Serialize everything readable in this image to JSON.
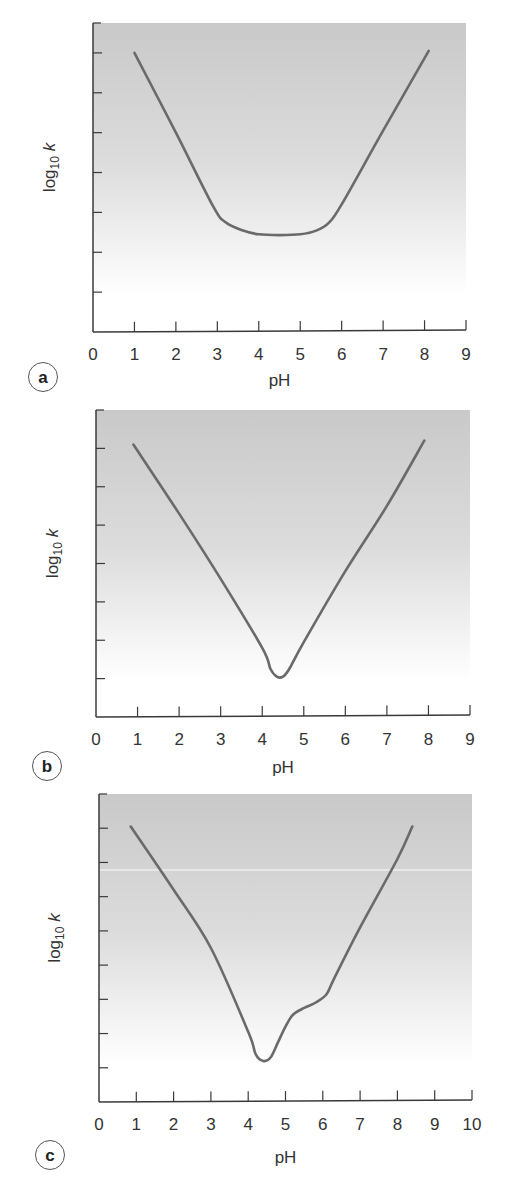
{
  "figure": {
    "panels": [
      "a",
      "b",
      "c"
    ]
  },
  "chart_data": [
    {
      "type": "line",
      "panel_label": "a",
      "title": "",
      "xlabel": "pH",
      "ylabel": "log10 k",
      "xlim": [
        0,
        9
      ],
      "x_ticks": [
        0,
        1,
        2,
        3,
        4,
        5,
        6,
        7,
        8,
        9
      ],
      "ylim": [
        0,
        7.75
      ],
      "y_ticks": [
        1,
        2,
        3,
        4,
        5,
        6,
        7
      ],
      "y_tick_labels_shown": false,
      "grid": false,
      "legend": null,
      "series": [
        {
          "name": "log10 k vs pH",
          "x": [
            1.0,
            2.0,
            2.9,
            3.2,
            3.6,
            4.0,
            4.5,
            5.0,
            5.4,
            5.7,
            6.0,
            7.0,
            8.1
          ],
          "y": [
            7.0,
            5.0,
            3.15,
            2.75,
            2.55,
            2.45,
            2.43,
            2.45,
            2.55,
            2.75,
            3.2,
            5.05,
            7.05
          ]
        }
      ]
    },
    {
      "type": "line",
      "panel_label": "b",
      "title": "",
      "xlabel": "pH",
      "ylabel": "log10 k",
      "xlim": [
        0,
        9
      ],
      "x_ticks": [
        0,
        1,
        2,
        3,
        4,
        5,
        6,
        7,
        8,
        9
      ],
      "ylim": [
        0,
        8
      ],
      "y_ticks": [
        1,
        2,
        3,
        4,
        5,
        6,
        7
      ],
      "y_tick_labels_shown": false,
      "grid": false,
      "legend": null,
      "series": [
        {
          "name": "log10 k vs pH",
          "x": [
            0.9,
            2.0,
            3.0,
            4.0,
            4.2,
            4.35,
            4.5,
            4.65,
            5.0,
            6.0,
            7.0,
            7.9
          ],
          "y": [
            7.1,
            5.3,
            3.6,
            1.8,
            1.25,
            1.05,
            1.05,
            1.25,
            1.95,
            3.8,
            5.5,
            7.2
          ]
        }
      ]
    },
    {
      "type": "line",
      "panel_label": "c",
      "title": "",
      "xlabel": "pH",
      "ylabel": "log10 k",
      "xlim": [
        0,
        10
      ],
      "x_ticks": [
        0,
        1,
        2,
        3,
        4,
        5,
        6,
        7,
        8,
        9,
        10
      ],
      "ylim": [
        0,
        9
      ],
      "y_ticks": [
        1,
        2,
        3,
        4,
        5,
        6,
        7,
        8
      ],
      "y_tick_labels_shown": false,
      "grid": false,
      "legend": null,
      "series": [
        {
          "name": "log10 k vs pH",
          "x": [
            0.85,
            2.0,
            3.0,
            4.0,
            4.2,
            4.4,
            4.6,
            4.8,
            5.0,
            5.2,
            5.5,
            5.8,
            6.1,
            6.3,
            7.0,
            8.0,
            8.4
          ],
          "y": [
            8.05,
            6.2,
            4.5,
            2.05,
            1.4,
            1.2,
            1.3,
            1.75,
            2.2,
            2.55,
            2.75,
            2.9,
            3.15,
            3.6,
            5.1,
            7.1,
            8.05
          ]
        }
      ]
    }
  ],
  "style": {
    "curve_color": "#6a6a6a",
    "axis_color": "#3a3a3a",
    "plot_bg_top": "#c9c9c9",
    "plot_bg_bottom": "#ffffff"
  }
}
